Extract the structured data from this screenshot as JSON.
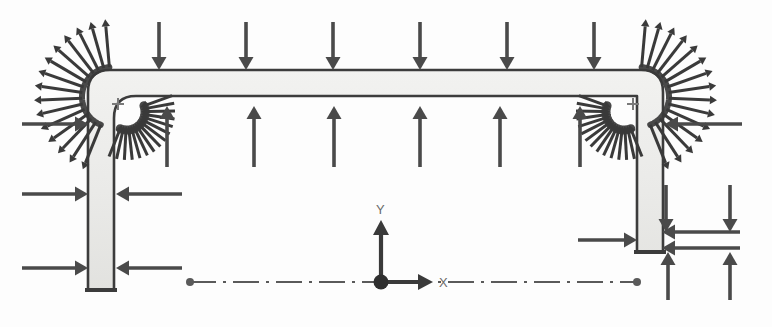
{
  "figure": {
    "type": "structural-load-diagram",
    "width": 772,
    "height": 327,
    "background_color": "#fdfdfd"
  },
  "colors": {
    "member_fill": "#e9e9e7",
    "member_outline": "#3c3c3c",
    "arrow": "#4a4a4a",
    "arrow_dark": "#3a3a3a",
    "centerline": "#5a5a5a",
    "node_marker": "#7a7a7a",
    "axis_label": "#6b6b6b"
  },
  "frame": {
    "shape": "portal-frame",
    "member_thickness": 26,
    "corner_radius": 22,
    "left_column": {
      "x": 88,
      "top": 82,
      "bottom": 290,
      "width": 26
    },
    "right_column": {
      "x": 637,
      "top": 82,
      "bottom": 252,
      "width": 26
    },
    "top_beam": {
      "left": 88,
      "right": 663,
      "top": 70,
      "thickness": 26
    }
  },
  "coordinate_system": {
    "origin_x": 381,
    "origin_y": 282,
    "x_axis_label": "X",
    "y_axis_label": "Y",
    "x_axis_length": 52,
    "y_axis_length": 62
  },
  "centerline": {
    "style": "dash-dot",
    "y": 282,
    "left_end_x": 190,
    "right_end_x": 637,
    "endpoint_marker": "round-dot"
  },
  "load_groups": [
    {
      "name": "top-beam-downward-distributed-load",
      "direction": "down",
      "count": 6,
      "x_positions": [
        159,
        246,
        333,
        420,
        507,
        594
      ],
      "tail_y": 22,
      "head_y": 70,
      "label": "downward distributed load on top beam"
    },
    {
      "name": "beam-soffit-upward-distributed-load",
      "direction": "up",
      "count": 6,
      "x_positions": [
        167,
        254,
        334,
        420,
        500,
        580
      ],
      "tail_y": 167,
      "head_y": 106,
      "label": "upward distributed load under beam"
    },
    {
      "name": "left-column-outer-pressure",
      "direction": "right",
      "count": 3,
      "y_positions": [
        124,
        194,
        268
      ],
      "tail_x": 22,
      "head_x": 88,
      "label": "inward pressure on left column outer face"
    },
    {
      "name": "left-column-inner-pressure",
      "direction": "left",
      "count": 2,
      "y_positions": [
        194,
        268
      ],
      "tail_x": 182,
      "head_x": 116,
      "label": "pressure on left column inner face"
    },
    {
      "name": "right-column-outer-pressure",
      "direction": "left",
      "count": 1,
      "y_positions": [
        124
      ],
      "tail_x": 742,
      "head_x": 665,
      "label": "inward pressure on right column outer face"
    },
    {
      "name": "right-column-base-inward",
      "direction": "right",
      "count": 1,
      "y_positions": [
        240
      ],
      "tail_x": 578,
      "head_x": 637,
      "label": "inward load at right column base"
    },
    {
      "name": "right-base-upward-reactions",
      "direction": "up",
      "count": 2,
      "x_positions": [
        668,
        730
      ],
      "tail_y": 300,
      "head_y": 252,
      "label": "upward reactions at right base"
    },
    {
      "name": "right-inner-vertical-downward",
      "direction": "down",
      "count": 2,
      "x_positions": [
        666,
        730
      ],
      "tail_y": 185,
      "head_y": 232,
      "label": "downward loads inside right column"
    },
    {
      "name": "right-inner-horizontal-left",
      "direction": "left",
      "count": 2,
      "y_positions": [
        232,
        248
      ],
      "tail_x": 740,
      "head_x": 662,
      "label": "leftward loads at right column interior"
    }
  ],
  "moment_fans": [
    {
      "name": "top-left-outer-moment-fan",
      "center_x": 112,
      "center_y": 97,
      "inner_radius": 30,
      "outer_radius": 78,
      "start_angle": 95,
      "end_angle": 248,
      "spoke_count": 15,
      "direction": "outward",
      "label": "outer radial moment fan at top-left corner"
    },
    {
      "name": "top-left-inner-moment-fan",
      "center_x": 127,
      "center_y": 112,
      "inner_radius": 14,
      "outer_radius": 48,
      "start_angle": 248,
      "end_angle": 380,
      "spoke_count": 15,
      "direction": "inward",
      "label": "inner radial moment fan at top-left corner"
    },
    {
      "name": "top-right-outer-moment-fan",
      "center_x": 639,
      "center_y": 97,
      "inner_radius": 30,
      "outer_radius": 78,
      "start_angle": -68,
      "end_angle": 85,
      "spoke_count": 15,
      "direction": "outward",
      "label": "outer radial moment fan at top-right corner"
    },
    {
      "name": "top-right-inner-moment-fan",
      "center_x": 624,
      "center_y": 112,
      "inner_radius": 14,
      "outer_radius": 48,
      "start_angle": 160,
      "end_angle": 292,
      "spoke_count": 15,
      "direction": "inward",
      "label": "inner radial moment fan at top-right corner"
    }
  ],
  "node_markers": [
    {
      "name": "node-marker-top-left",
      "x": 118,
      "y": 104,
      "glyph": "plus"
    },
    {
      "name": "node-marker-top-right",
      "x": 633,
      "y": 104,
      "glyph": "plus"
    }
  ]
}
